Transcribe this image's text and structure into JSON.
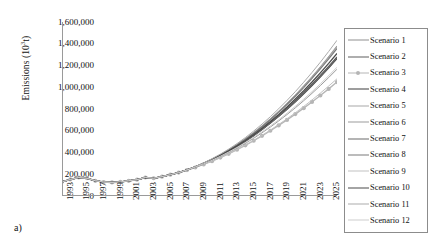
{
  "figure": {
    "sublabel": "a)",
    "ylabel_main": "Emissions (10",
    "ylabel_sup": "3",
    "ylabel_tail": "t)"
  },
  "chart_data": {
    "type": "line",
    "title": "",
    "xlabel": "",
    "ylabel": "Emissions (10³t)",
    "ylim": [
      0,
      1600000
    ],
    "ytick_labels": [
      "1,600,000",
      "1,400,000",
      "1,200,000",
      "1,000,000",
      "800,000",
      "600,000",
      "400,000",
      "200,000",
      "0"
    ],
    "ytick_values": [
      1600000,
      1400000,
      1200000,
      1000000,
      800000,
      600000,
      400000,
      200000,
      0
    ],
    "xlim": [
      1993,
      2026
    ],
    "xtick_labels": [
      "1993",
      "1995",
      "1997",
      "1999",
      "2001",
      "2003",
      "2005",
      "2007",
      "2009",
      "2011",
      "2013",
      "2015",
      "2017",
      "2019",
      "2021",
      "2023",
      "2025"
    ],
    "xtick_values": [
      1993,
      1995,
      1997,
      1999,
      2001,
      2003,
      2005,
      2007,
      2009,
      2011,
      2013,
      2015,
      2017,
      2019,
      2021,
      2023,
      2025
    ],
    "grid": false,
    "legend_position": "right",
    "x": [
      1993,
      1994,
      1995,
      1996,
      1997,
      1998,
      1999,
      2000,
      2001,
      2002,
      2003,
      2004,
      2005,
      2006,
      2007,
      2008,
      2009,
      2010,
      2011,
      2012,
      2013,
      2014,
      2015,
      2016,
      2017,
      2018,
      2019,
      2020,
      2021,
      2022,
      2023,
      2024,
      2025,
      2026
    ],
    "series": [
      {
        "name": "Scenario 1",
        "color": "#8f8f8f",
        "width": 1.1,
        "marker": "none",
        "values": [
          130000,
          152000,
          170000,
          163000,
          140000,
          128000,
          125000,
          129000,
          140000,
          150000,
          170000,
          163000,
          178000,
          196000,
          215000,
          240000,
          268000,
          300000,
          335000,
          375000,
          420000,
          468000,
          520000,
          578000,
          640000,
          706000,
          776000,
          850000,
          928000,
          1010000,
          1096000,
          1186000,
          1280000,
          1378000
        ]
      },
      {
        "name": "Scenario 2",
        "color": "#5e5e5e",
        "width": 1.2,
        "marker": "none",
        "values": [
          130000,
          152000,
          170000,
          163000,
          140000,
          128000,
          125000,
          129000,
          140000,
          150000,
          170000,
          163000,
          178000,
          196000,
          215000,
          240000,
          266000,
          296000,
          330000,
          368000,
          410000,
          455000,
          504000,
          557000,
          614000,
          674000,
          738000,
          805000,
          876000,
          950000,
          1028000,
          1108000,
          1192000,
          1278000
        ]
      },
      {
        "name": "Scenario 3",
        "color": "#b5b5b5",
        "width": 1.3,
        "marker": "circle",
        "values": [
          130000,
          152000,
          170000,
          163000,
          140000,
          128000,
          125000,
          129000,
          140000,
          150000,
          170000,
          163000,
          178000,
          196000,
          215000,
          238000,
          262000,
          290000,
          320000,
          353000,
          388000,
          426000,
          466000,
          508000,
          553000,
          600000,
          649000,
          700000,
          753000,
          808000,
          865000,
          924000,
          985000,
          1048000
        ]
      },
      {
        "name": "Scenario 4",
        "color": "#3c3c3c",
        "width": 1.5,
        "marker": "none",
        "values": [
          130000,
          152000,
          170000,
          163000,
          140000,
          128000,
          125000,
          129000,
          140000,
          150000,
          170000,
          163000,
          178000,
          196000,
          215000,
          240000,
          268000,
          299000,
          333000,
          371000,
          412000,
          457000,
          505000,
          557000,
          612000,
          671000,
          733000,
          799000,
          868000,
          941000,
          1017000,
          1097000,
          1180000,
          1266000
        ]
      },
      {
        "name": "Scenario 5",
        "color": "#a8a8a8",
        "width": 1.0,
        "marker": "none",
        "values": [
          130000,
          152000,
          170000,
          163000,
          140000,
          128000,
          125000,
          129000,
          140000,
          150000,
          170000,
          163000,
          178000,
          196000,
          215000,
          241000,
          270000,
          303000,
          340000,
          381000,
          426000,
          475000,
          528000,
          585000,
          646000,
          711000,
          780000,
          853000,
          930000,
          1011000,
          1096000,
          1185000,
          1278000,
          1375000
        ]
      },
      {
        "name": "Scenario 6",
        "color": "#9c9c9c",
        "width": 1.0,
        "marker": "none",
        "values": [
          130000,
          152000,
          170000,
          163000,
          140000,
          128000,
          125000,
          129000,
          140000,
          150000,
          170000,
          163000,
          178000,
          196000,
          215000,
          239000,
          265000,
          294000,
          326000,
          361000,
          399000,
          440000,
          484000,
          531000,
          581000,
          634000,
          690000,
          749000,
          811000,
          876000,
          944000,
          1015000,
          1089000,
          1166000
        ]
      },
      {
        "name": "Scenario 7",
        "color": "#6b6b6b",
        "width": 1.2,
        "marker": "none",
        "values": [
          130000,
          152000,
          170000,
          163000,
          140000,
          128000,
          125000,
          129000,
          140000,
          150000,
          170000,
          163000,
          178000,
          196000,
          215000,
          240000,
          267000,
          297000,
          331000,
          369000,
          410000,
          455000,
          503000,
          555000,
          611000,
          670000,
          733000,
          799000,
          869000,
          942000,
          1019000,
          1099000,
          1183000,
          1270000
        ]
      },
      {
        "name": "Scenario 8",
        "color": "#7a7a7a",
        "width": 1.2,
        "marker": "none",
        "values": [
          130000,
          152000,
          170000,
          163000,
          140000,
          128000,
          125000,
          129000,
          140000,
          150000,
          170000,
          163000,
          178000,
          196000,
          215000,
          240000,
          269000,
          301000,
          337000,
          377000,
          421000,
          469000,
          521000,
          577000,
          637000,
          701000,
          769000,
          841000,
          917000,
          997000,
          1081000,
          1169000,
          1261000,
          1357000
        ]
      },
      {
        "name": "Scenario 9",
        "color": "#c2c2c2",
        "width": 1.0,
        "marker": "none",
        "values": [
          130000,
          152000,
          170000,
          163000,
          140000,
          128000,
          125000,
          129000,
          140000,
          150000,
          170000,
          163000,
          178000,
          196000,
          215000,
          238000,
          263000,
          291000,
          321000,
          354000,
          390000,
          428000,
          469000,
          512000,
          558000,
          606000,
          657000,
          710000,
          765000,
          823000,
          883000,
          946000,
          1011000,
          1078000
        ]
      },
      {
        "name": "Scenario 10",
        "color": "#4a4a4a",
        "width": 1.3,
        "marker": "none",
        "values": [
          130000,
          152000,
          170000,
          163000,
          140000,
          128000,
          125000,
          129000,
          140000,
          150000,
          170000,
          163000,
          178000,
          196000,
          215000,
          240000,
          268000,
          300000,
          334000,
          373000,
          415000,
          461000,
          511000,
          565000,
          623000,
          685000,
          750000,
          819000,
          892000,
          968000,
          1048000,
          1132000,
          1219000,
          1310000
        ]
      },
      {
        "name": "Scenario 11",
        "color": "#ababab",
        "width": 1.0,
        "marker": "none",
        "values": [
          130000,
          152000,
          170000,
          163000,
          140000,
          128000,
          125000,
          129000,
          140000,
          150000,
          170000,
          163000,
          178000,
          196000,
          215000,
          241000,
          271000,
          305000,
          343000,
          385000,
          431000,
          482000,
          537000,
          597000,
          661000,
          729000,
          802000,
          879000,
          960000,
          1046000,
          1136000,
          1230000,
          1329000,
          1432000
        ]
      },
      {
        "name": "Scenario 12",
        "color": "#cdcdcd",
        "width": 1.0,
        "marker": "none",
        "values": [
          130000,
          152000,
          170000,
          163000,
          140000,
          128000,
          125000,
          129000,
          140000,
          150000,
          170000,
          163000,
          178000,
          196000,
          215000,
          239000,
          266000,
          296000,
          329000,
          365000,
          404000,
          446000,
          491000,
          539000,
          590000,
          644000,
          701000,
          761000,
          824000,
          890000,
          959000,
          1031000,
          1106000,
          1184000
        ]
      }
    ]
  }
}
